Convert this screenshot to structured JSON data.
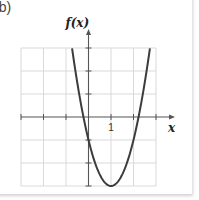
{
  "panel_label": "(b)",
  "chart_data": {
    "type": "line",
    "title": "",
    "xlabel": "x",
    "ylabel": "f(x)",
    "xlim": [
      -3,
      3
    ],
    "ylim": [
      -3,
      3
    ],
    "grid": true,
    "x_ticks": [
      -3,
      -2,
      -1,
      0,
      1,
      2,
      3
    ],
    "y_ticks": [
      -3,
      -2,
      -1,
      0,
      1,
      2,
      3
    ],
    "tick_labels": [
      {
        "axis": "x",
        "value": 1,
        "text": "1"
      }
    ],
    "series": [
      {
        "name": "f(x)",
        "function": "2(x-1)^2 - 3",
        "x": [
          -0.73,
          -0.5,
          -0.22,
          0,
          0.5,
          1,
          1.5,
          2,
          2.22,
          2.5,
          2.73
        ],
        "y": [
          3,
          1.5,
          0,
          -1,
          -2.5,
          -3,
          -2.5,
          -1,
          0,
          1.5,
          3
        ]
      }
    ],
    "colors": {
      "curve": "#3c3c3c",
      "axis": "#555555",
      "grid": "#d9d9d9"
    }
  }
}
